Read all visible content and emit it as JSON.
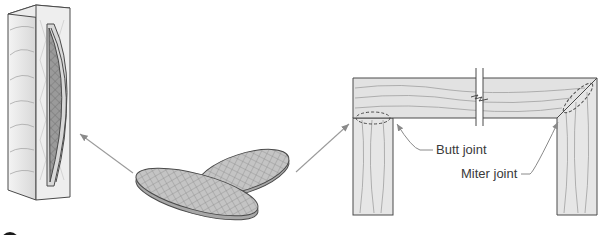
{
  "figure": {
    "labels": {
      "butt_joint": "Butt joint",
      "miter_joint": "Miter joint"
    },
    "colors": {
      "wood_fill": "#e6e6e6",
      "wood_dark": "#cfcfcf",
      "biscuit_fill": "#bdbdbd",
      "slot_fill": "#8f8f8f",
      "outline": "#4a4a4a",
      "grain": "#9a9a9a",
      "arrow": "#9b9b9b",
      "label_text": "#3a3a3a"
    },
    "components": [
      {
        "name": "slotted-board",
        "shows": "biscuit inserted in slot"
      },
      {
        "name": "loose-biscuits",
        "count": 2
      },
      {
        "name": "frame",
        "joints": [
          "Butt joint",
          "Miter joint"
        ]
      }
    ],
    "bleed_through": [
      "Joining methods for wood frames",
      "Accessories and fasteners"
    ]
  }
}
